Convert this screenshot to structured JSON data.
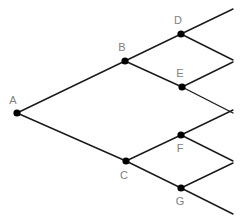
{
  "diagram": {
    "type": "tree",
    "canvas": {
      "width": 244,
      "height": 223
    },
    "style": {
      "background_color": "#ffffff",
      "edge_color": "#1a1a1a",
      "node_color": "#000000",
      "label_color": "#808080",
      "node_radius": 3.6,
      "edge_width": 1.4,
      "label_font_size": 11
    },
    "nodes": [
      {
        "id": "A",
        "label": "A",
        "x": 17,
        "y": 113,
        "label_x": 13,
        "label_y": 101,
        "label_position": "above-left"
      },
      {
        "id": "B",
        "label": "B",
        "x": 125,
        "y": 61,
        "label_x": 122,
        "label_y": 48,
        "label_position": "above-left"
      },
      {
        "id": "C",
        "label": "C",
        "x": 126,
        "y": 161,
        "label_x": 124,
        "label_y": 176,
        "label_position": "below-left"
      },
      {
        "id": "D",
        "label": "D",
        "x": 181,
        "y": 34,
        "label_x": 178,
        "label_y": 21,
        "label_position": "above-left"
      },
      {
        "id": "E",
        "label": "E",
        "x": 182,
        "y": 87,
        "label_x": 180,
        "label_y": 74,
        "label_position": "above"
      },
      {
        "id": "F",
        "label": "F",
        "x": 181,
        "y": 135,
        "label_x": 180,
        "label_y": 149,
        "label_position": "below"
      },
      {
        "id": "G",
        "label": "G",
        "x": 181,
        "y": 188,
        "label_x": 180,
        "label_y": 202,
        "label_position": "below"
      }
    ],
    "edges": [
      {
        "id": "A-B",
        "from": "A",
        "to": "B",
        "x1": 17,
        "y1": 113,
        "x2": 125,
        "y2": 61
      },
      {
        "id": "A-C",
        "from": "A",
        "to": "C",
        "x1": 17,
        "y1": 113,
        "x2": 126,
        "y2": 161
      },
      {
        "id": "B-D",
        "from": "B",
        "to": "D",
        "x1": 125,
        "y1": 61,
        "x2": 181,
        "y2": 34
      },
      {
        "id": "B-E",
        "from": "B",
        "to": "E",
        "x1": 125,
        "y1": 61,
        "x2": 182,
        "y2": 87
      },
      {
        "id": "C-F",
        "from": "C",
        "to": "F",
        "x1": 126,
        "y1": 161,
        "x2": 181,
        "y2": 135
      },
      {
        "id": "C-G",
        "from": "C",
        "to": "G",
        "x1": 126,
        "y1": 161,
        "x2": 181,
        "y2": 188
      },
      {
        "id": "D-up",
        "from": "D",
        "to": null,
        "x1": 181,
        "y1": 34,
        "x2": 233,
        "y2": 9
      },
      {
        "id": "D-down",
        "from": "D",
        "to": null,
        "x1": 181,
        "y1": 34,
        "x2": 233,
        "y2": 60
      },
      {
        "id": "E-up",
        "from": "E",
        "to": null,
        "x1": 182,
        "y1": 87,
        "x2": 233,
        "y2": 62
      },
      {
        "id": "E-down",
        "from": "E",
        "to": null,
        "x1": 182,
        "y1": 87,
        "x2": 233,
        "y2": 113
      },
      {
        "id": "F-up",
        "from": "F",
        "to": null,
        "x1": 181,
        "y1": 135,
        "x2": 233,
        "y2": 110
      },
      {
        "id": "F-down",
        "from": "F",
        "to": null,
        "x1": 181,
        "y1": 135,
        "x2": 233,
        "y2": 161
      },
      {
        "id": "G-up",
        "from": "G",
        "to": null,
        "x1": 181,
        "y1": 188,
        "x2": 233,
        "y2": 163
      },
      {
        "id": "G-down",
        "from": "G",
        "to": null,
        "x1": 181,
        "y1": 188,
        "x2": 233,
        "y2": 214
      }
    ]
  }
}
